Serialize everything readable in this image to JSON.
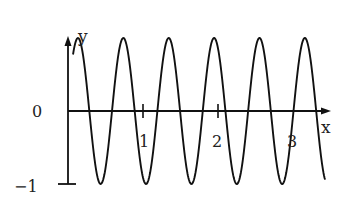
{
  "chart_data": {
    "type": "line",
    "title": "",
    "xlabel": "x",
    "ylabel": "y",
    "x_ticks": [
      1,
      2,
      3
    ],
    "x_tick_labels": [
      "1",
      "2",
      "3"
    ],
    "y_ticks": [
      0,
      -1
    ],
    "y_tick_labels": [
      "0",
      "−1"
    ],
    "xlim": [
      0,
      3.47
    ],
    "ylim": [
      -1,
      1
    ],
    "grid": false,
    "legend": null,
    "series": [
      {
        "name": "y = cos(2π(x − 0.133)/0.605)",
        "function": {
          "form": "cosine",
          "amplitude": 1,
          "period": 0.605,
          "phase_peak_x": 0.133
        },
        "x_range": [
          0.067,
          3.427
        ],
        "peaks_x": [
          0.13,
          0.75,
          1.35,
          1.96,
          2.55,
          3.16
        ],
        "troughs_x": [
          0.43,
          1.05,
          1.65,
          2.24,
          2.87
        ],
        "start_point": [
          0.067,
          0.72
        ],
        "end_point": [
          3.427,
          -0.93
        ]
      }
    ]
  },
  "axes": {
    "x_label": "x",
    "y_label": "y",
    "zero_label": "0",
    "neg_one_label": "−1",
    "tick1_label": "1",
    "tick2_label": "2",
    "tick3_label": "3"
  },
  "style": {
    "line_color": "#111111",
    "axis_color": "#111111"
  }
}
